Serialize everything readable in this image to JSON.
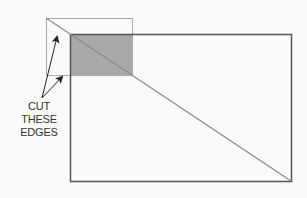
{
  "diagram": {
    "label_lines": [
      "CUT",
      "THESE",
      "EDGES"
    ],
    "colors": {
      "background": "#fafafa",
      "paper_outline": "#555555",
      "overlay_outline": "#aaaaaa",
      "overlap_fill": "#a9a9a9",
      "diagonal": "#888888",
      "arrow": "#222222"
    },
    "shapes": {
      "paper_rect": {
        "x": 70,
        "y": 34,
        "w": 221,
        "h": 147
      },
      "overlay_rect": {
        "x": 46,
        "y": 18,
        "w": 86,
        "h": 57
      },
      "overlap_region": {
        "x": 70,
        "y": 34,
        "w": 62,
        "h": 41
      },
      "diagonal": {
        "x1": 46,
        "y1": 18,
        "x2": 291,
        "y2": 181
      },
      "arrows": [
        {
          "from": [
            42,
            98
          ],
          "to": [
            57,
            36
          ]
        },
        {
          "from": [
            42,
            98
          ],
          "to": [
            62,
            77
          ]
        }
      ]
    }
  }
}
